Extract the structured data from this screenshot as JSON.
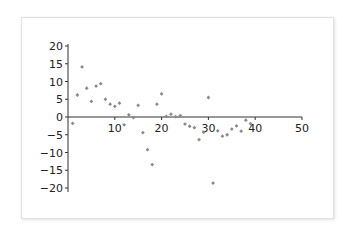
{
  "chart_data": {
    "type": "scatter",
    "title": "",
    "xlabel": "",
    "ylabel": "",
    "xlim": [
      0,
      50
    ],
    "ylim": [
      -20,
      20
    ],
    "x_ticks": [
      10,
      20,
      30,
      40,
      50
    ],
    "y_ticks": [
      20,
      15,
      10,
      5,
      0,
      -5,
      -10,
      -15,
      -20
    ],
    "grid": false,
    "legend": null,
    "marker_color": "#8a8a8a",
    "axis_color": "#333333",
    "series": [
      {
        "name": "series1",
        "x": [
          1,
          2,
          3,
          4,
          5,
          6,
          7,
          8,
          9,
          10,
          11,
          12,
          13,
          14,
          15,
          16,
          17,
          18,
          19,
          20,
          21,
          22,
          23,
          24,
          25,
          26,
          27,
          28,
          29,
          30,
          31,
          32,
          33,
          34,
          35,
          36,
          37,
          38,
          39
        ],
        "y": [
          -1.8,
          6.2,
          14.1,
          8.1,
          4.4,
          8.7,
          9.4,
          5.0,
          3.6,
          3.0,
          3.9,
          -2.2,
          0.6,
          -0.2,
          3.3,
          -4.4,
          -9.2,
          -13.4,
          3.6,
          6.5,
          0.2,
          0.8,
          0.1,
          0.4,
          -2.0,
          -2.6,
          -3.0,
          -6.4,
          -4.3,
          5.5,
          -18.6,
          -3.9,
          -5.4,
          -5.0,
          -3.4,
          -2.5,
          -4.0,
          -0.9,
          -1.9
        ]
      }
    ]
  }
}
